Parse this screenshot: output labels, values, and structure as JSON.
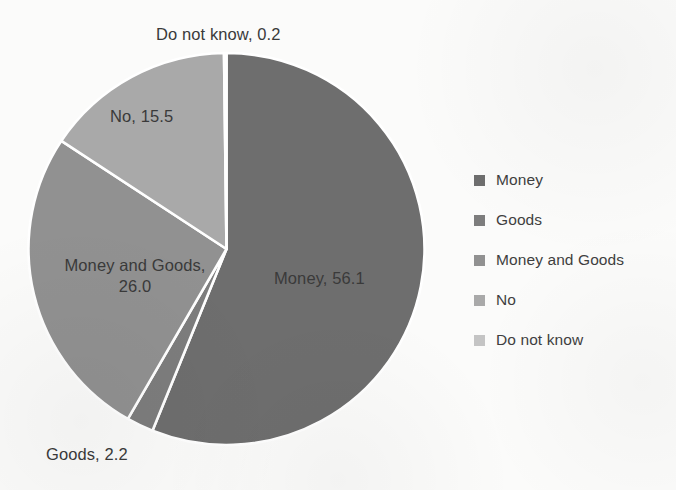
{
  "chart_data": {
    "type": "pie",
    "title": "",
    "categories": [
      "Money",
      "Goods",
      "Money and Goods",
      "No",
      "Do not know"
    ],
    "values": [
      56.1,
      2.2,
      26.0,
      15.5,
      0.2
    ],
    "value_labels": [
      "Money, 56.1",
      "Goods, 2.2",
      "Money and Goods, 26.0",
      "No, 15.5",
      "Do not know, 0.2"
    ],
    "legend_position": "right",
    "grid": false,
    "start_angle_deg": 0,
    "direction": "clockwise",
    "colors": [
      "#6e6e6e",
      "#7d7d7d",
      "#919191",
      "#a9a9a9",
      "#c4c4c4"
    ],
    "divider_color": "#ffffff",
    "background": "#fbfbfa"
  },
  "labels": {
    "do_not_know": "Do not know, 0.2",
    "no": "No, 15.5",
    "money_and_goods_line1": "Money and Goods,",
    "money_and_goods_line2": "26.0",
    "money": "Money, 56.1",
    "goods": "Goods, 2.2"
  },
  "legend": {
    "items": [
      {
        "label": "Money",
        "color": "#6e6e6e",
        "swatch_icon": "square-swatch-icon"
      },
      {
        "label": "Goods",
        "color": "#7d7d7d",
        "swatch_icon": "square-swatch-icon"
      },
      {
        "label": "Money and Goods",
        "color": "#919191",
        "swatch_icon": "square-swatch-icon"
      },
      {
        "label": "No",
        "color": "#a9a9a9",
        "swatch_icon": "square-swatch-icon"
      },
      {
        "label": "Do not know",
        "color": "#c4c4c4",
        "swatch_icon": "square-swatch-icon"
      }
    ]
  }
}
